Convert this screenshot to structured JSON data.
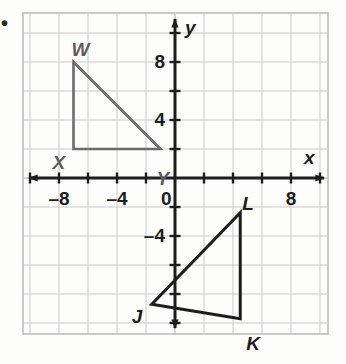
{
  "figure": {
    "kind": "coordinate-plane",
    "bullet_marker": "•",
    "axes": {
      "x_label": "x",
      "y_label": "y",
      "x_tick_labels": [
        "–8",
        "–4",
        "0",
        "8"
      ],
      "x_tick_values": [
        -8,
        -4,
        0,
        8
      ],
      "y_tick_labels": [
        "8",
        "4",
        "–4"
      ],
      "y_tick_values": [
        8,
        4,
        -4
      ],
      "x_range": [
        -10.5,
        10.5
      ],
      "y_range": [
        -11.4,
        11.4
      ],
      "tick_interval": 2,
      "grid_interval": 2,
      "grid_color": "#c9c9c9",
      "axis_color": "#1d1d1d",
      "frame_color": "#bdbdbd"
    },
    "shapes": [
      {
        "name": "triangle-WXY",
        "color": "#6b6b6b",
        "stroke_width": 2.6,
        "vertices": [
          {
            "label": "W",
            "x": -7,
            "y": 8,
            "label_dx": -2,
            "label_dy": -22
          },
          {
            "label": "X",
            "x": -7,
            "y": 2,
            "label_dx": -21,
            "label_dy": 4
          },
          {
            "label": "Y",
            "x": -1,
            "y": 2,
            "label_dx": -4,
            "label_dy": 20
          }
        ]
      },
      {
        "name": "triangle-JKL",
        "color": "#1d1d1d",
        "stroke_width": 3.0,
        "vertices": [
          {
            "label": "J",
            "x": -1.6,
            "y": -8.7,
            "label_dx": -20,
            "label_dy": 3
          },
          {
            "label": "K",
            "x": 4.5,
            "y": -9.7,
            "label_dx": 6,
            "label_dy": 15
          },
          {
            "label": "L",
            "x": 4.5,
            "y": -2.4,
            "label_dx": 2,
            "label_dy": -19
          }
        ]
      }
    ]
  }
}
